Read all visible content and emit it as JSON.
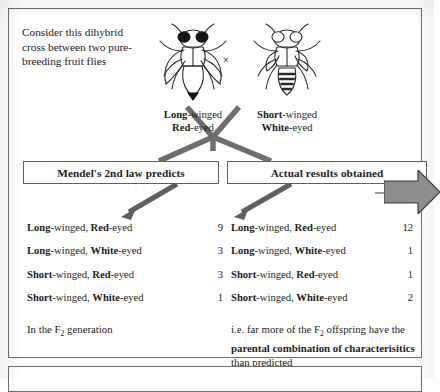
{
  "figure": {
    "intro_text": "Consider this dihybrid cross between two pure-breeding fruit flies",
    "cross_symbol": "×"
  },
  "parents": [
    {
      "name": "long-winged-red-eyed-fly",
      "trait_wing_bold": "Long",
      "trait_wing_rest": "-winged",
      "trait_eye_bold": "Red",
      "trait_eye_rest": "-eyed",
      "eye_color": "#111111",
      "wing_type": "long"
    },
    {
      "name": "short-winged-white-eyed-fly",
      "trait_wing_bold": "Short",
      "trait_wing_rest": "-winged",
      "trait_eye_bold": "White",
      "trait_eye_rest": "-eyed",
      "eye_color": "#ffffff",
      "wing_type": "short"
    }
  ],
  "headers": {
    "left": "Mendel's 2nd law predicts",
    "right": "Actual results obtained"
  },
  "predicted": {
    "rows": [
      {
        "wing_bold": "Long",
        "wing_rest": "-winged, ",
        "eye_bold": "Red",
        "eye_rest": "-eyed",
        "count": "9"
      },
      {
        "wing_bold": "Long",
        "wing_rest": "-winged, ",
        "eye_bold": "White",
        "eye_rest": "-eyed",
        "count": "3"
      },
      {
        "wing_bold": "Short",
        "wing_rest": "-winged, ",
        "eye_bold": "Red",
        "eye_rest": "-eyed",
        "count": "3"
      },
      {
        "wing_bold": "Short",
        "wing_rest": "-winged, ",
        "eye_bold": "White",
        "eye_rest": "-eyed",
        "count": "1"
      }
    ],
    "note_prefix": "In the F",
    "note_sub": "2",
    "note_suffix": " generation"
  },
  "actual": {
    "rows": [
      {
        "wing_bold": "Long",
        "wing_rest": "-winged, ",
        "eye_bold": "Red",
        "eye_rest": "-eyed",
        "count": "12"
      },
      {
        "wing_bold": "Long",
        "wing_rest": "-winged, ",
        "eye_bold": "White",
        "eye_rest": "-eyed",
        "count": "1"
      },
      {
        "wing_bold": "Short",
        "wing_rest": "-winged, ",
        "eye_bold": "Red",
        "eye_rest": "-eyed",
        "count": "1"
      },
      {
        "wing_bold": "Short",
        "wing_rest": "-winged, ",
        "eye_bold": "White",
        "eye_rest": "-eyed",
        "count": "2"
      }
    ],
    "note_line1_prefix": "i.e. far more of the F",
    "note_line1_sub": "2",
    "note_line1_suffix": " offspring have the",
    "note_line2_bold": "parental combination of characterisitics",
    "note_line3": "than predicted"
  },
  "callout": {
    "label": "WHY?"
  },
  "colors": {
    "connector_gray": "#6e6e6e",
    "arrow_gray": "#5f5f5f",
    "callout_fill": "#8d8d8d",
    "border": "#6d6d6d",
    "ink": "#1d1d1d"
  }
}
